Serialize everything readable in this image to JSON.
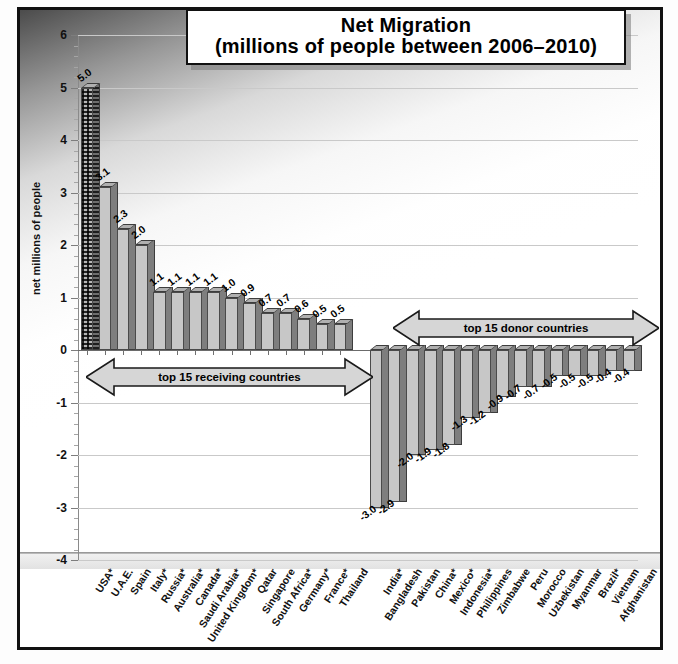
{
  "chart_data": {
    "type": "bar",
    "title": "Net Migration",
    "subtitle": "(millions of people between 2006–2010)",
    "xlabel": "",
    "ylabel": "net millions of people",
    "ylim": [
      -4,
      6
    ],
    "yticks": [
      6,
      5,
      4,
      3,
      2,
      1,
      0,
      -1,
      -2,
      -3,
      -4
    ],
    "ytick_labels": [
      "6",
      "5",
      "4",
      "3",
      "2",
      "1",
      "0",
      "-1",
      "-2",
      "-3",
      "-4"
    ],
    "grid": true,
    "legend": "none",
    "categories": [
      "USA*",
      "U.A.E.",
      "Spain",
      "Italy*",
      "Russia*",
      "Australia*",
      "Canada*",
      "Saudi Arabia*",
      "United Kingdom*",
      "Qatar",
      "Singapore",
      "South Africa*",
      "Germany*",
      "France*",
      "Thailand",
      "India*",
      "Bangladesh",
      "Pakistan",
      "China*",
      "Mexico*",
      "Indonesia*",
      "Philippines",
      "Zimbabwe",
      "Peru",
      "Morocco",
      "Uzbekistan",
      "Myanmar",
      "Brazil*",
      "Vietnam",
      "Afghanistan"
    ],
    "values": [
      5.0,
      3.1,
      2.3,
      2.0,
      1.1,
      1.1,
      1.1,
      1.1,
      1.0,
      0.9,
      0.7,
      0.7,
      0.6,
      0.5,
      0.5,
      -3.0,
      -2.9,
      -2.0,
      -1.9,
      -1.8,
      -1.3,
      -1.2,
      -0.9,
      -0.7,
      -0.7,
      -0.5,
      -0.5,
      -0.5,
      -0.4,
      -0.4
    ],
    "data_labels": [
      "5.0",
      "3.1",
      "2.3",
      "2.0",
      "1.1",
      "1.1",
      "1.1",
      "1.1",
      "1.0",
      "0.9",
      "0.7",
      "0.7",
      "0.6",
      "0.5",
      "0.5",
      "-3.0",
      "-2.9",
      "-2.0",
      "-1.9",
      "-1.8",
      "-1.3",
      "-1.2",
      "-0.9",
      "-0.7",
      "-0.7",
      "-0.5",
      "-0.5",
      "-0.5",
      "-0.4",
      "-0.4"
    ],
    "highlighted_category": "USA*",
    "annotations": [
      {
        "text": "top 15 receiving countries",
        "style": "double-headed-arrow",
        "span": [
          "USA*",
          "Thailand"
        ]
      },
      {
        "text": "top 15 donor countries",
        "style": "double-headed-arrow",
        "span": [
          "India*",
          "Afghanistan"
        ]
      }
    ],
    "colors": {
      "bar_face": "#c7c7c7",
      "bar_side": "#7e7e7e",
      "bar_outline": "#4a4a4a",
      "gridline": "#c9c9c9",
      "zero_line": "#6b6b6b",
      "text": "#000000",
      "frame": "#111111"
    }
  }
}
